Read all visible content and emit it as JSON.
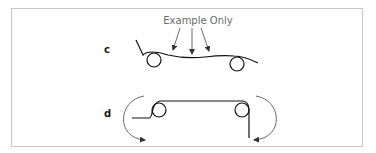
{
  "figure": {
    "caption": "Example Only",
    "panels": [
      {
        "label": "c",
        "description": "Web passing over two rollers with downward pressure arrows"
      },
      {
        "label": "d",
        "description": "Web wrapping two rollers with curved direction arrows on each side"
      }
    ]
  },
  "colors": {
    "frame_border": "#c6c6c6",
    "line": "#111111",
    "arrow": "#333333",
    "caption_text": "#6a6a6a"
  }
}
